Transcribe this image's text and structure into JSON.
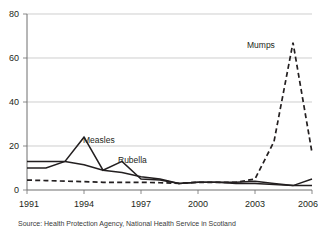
{
  "chart_data": {
    "type": "line",
    "title": "",
    "subtitle": "",
    "xlabel": "",
    "ylabel": "",
    "xlim": [
      1991,
      2006
    ],
    "ylim": [
      0,
      80
    ],
    "yticks": [
      0,
      20,
      40,
      60,
      80
    ],
    "xticks": [
      1991,
      1994,
      1997,
      2000,
      2003,
      2006
    ],
    "xtick_labels": [
      "1991",
      "1994",
      "1997",
      "2000",
      "2003",
      "2006"
    ],
    "ytick_labels": [
      "0",
      "20",
      "40",
      "60",
      "80"
    ],
    "grid": "horizontal",
    "legend": "inline-annotations",
    "x": [
      1991,
      1992,
      1993,
      1994,
      1995,
      1996,
      1997,
      1998,
      1999,
      2000,
      2001,
      2002,
      2003,
      2004,
      2005,
      2006
    ],
    "series": [
      {
        "name": "Measles",
        "style": "solid",
        "color": "#231f20",
        "values": [
          10,
          10,
          13,
          24,
          9,
          13,
          5,
          4.5,
          3,
          3.5,
          3.5,
          3.5,
          4,
          3,
          2,
          5
        ]
      },
      {
        "name": "Rubella",
        "style": "solid",
        "color": "#231f20",
        "values": [
          13,
          13,
          13,
          11.5,
          9,
          8,
          6,
          5,
          3,
          3.5,
          3.5,
          3,
          3,
          2.5,
          2,
          2
        ]
      },
      {
        "name": "Mumps",
        "style": "dashed",
        "color": "#231f20",
        "values": [
          4.5,
          4.3,
          4,
          3.8,
          3.5,
          3.5,
          3.5,
          3.3,
          3,
          3.5,
          3.5,
          3.5,
          5,
          22,
          67,
          17
        ]
      }
    ],
    "annotations": [
      {
        "text": "Measles",
        "x": 1994.45,
        "y": 25.5
      },
      {
        "text": "Rubella",
        "x": 1996.6,
        "y": 16.5
      },
      {
        "text": "Mumps",
        "x": 2003.6,
        "y": 68
      }
    ]
  },
  "caption": {
    "source_text": "Source: Health Protection Agency, National Health Service in Scotland"
  }
}
